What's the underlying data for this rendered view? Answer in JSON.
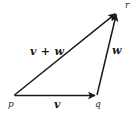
{
  "figure": {
    "type": "vector-addition-triangle",
    "background_color": "#ffffff",
    "stroke_color": "#1a1a1a",
    "width": 139,
    "height": 116,
    "points": {
      "p": {
        "label": "p",
        "x": 14,
        "y": 96
      },
      "q": {
        "label": "q",
        "x": 97,
        "y": 96
      },
      "r": {
        "label": "r",
        "x": 118,
        "y": 11
      }
    },
    "vectors": [
      {
        "name": "v",
        "label": "v",
        "from": "p",
        "to": "q",
        "description": "horizontal arrow from p to q"
      },
      {
        "name": "w",
        "label": "w",
        "from": "q",
        "to": "r",
        "description": "steep arrow from q up to r"
      },
      {
        "name": "v_plus_w",
        "label": "v + w",
        "from": "p",
        "to": "r",
        "description": "resultant diagonal arrow from p to r"
      }
    ]
  }
}
